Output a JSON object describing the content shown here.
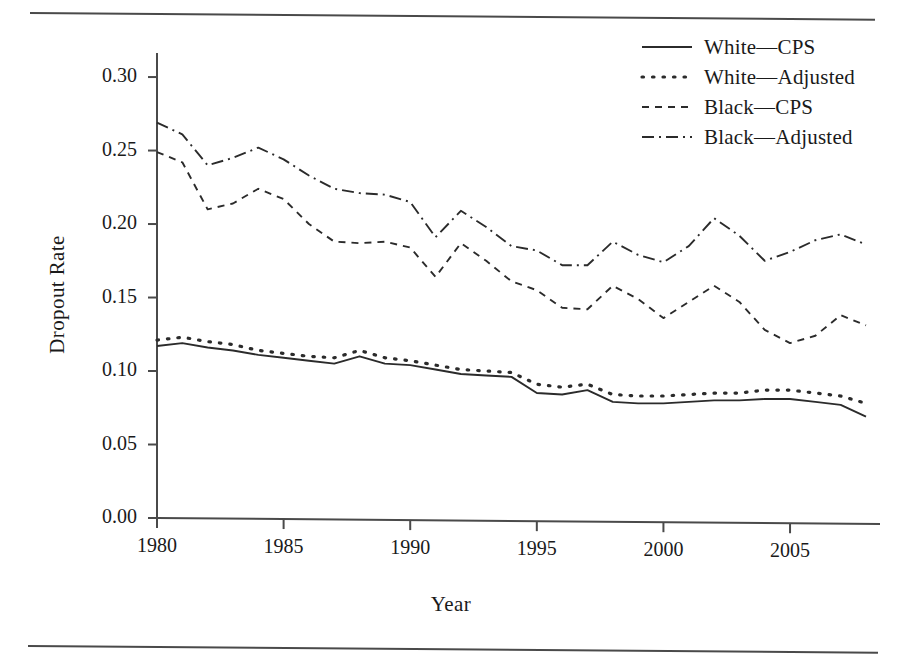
{
  "figure": {
    "has_top_rule": true,
    "has_bottom_rule": true,
    "ink_color": "#2b2b2b",
    "axis_color": "#4a4a4a",
    "background": "#ffffff"
  },
  "chart_data": {
    "type": "line",
    "title": "",
    "xlabel": "Year",
    "ylabel": "Dropout Rate",
    "xlim": [
      1980,
      2008
    ],
    "ylim": [
      0.0,
      0.315
    ],
    "grid": false,
    "legend_position": "top-right",
    "xticks": [
      1980,
      1985,
      1990,
      1995,
      2000,
      2005
    ],
    "xtick_labels": [
      "1980",
      "1985",
      "1990",
      "1995",
      "2000",
      "2005"
    ],
    "yticks": [
      0.0,
      0.05,
      0.1,
      0.15,
      0.2,
      0.25,
      0.3
    ],
    "ytick_labels": [
      "0.00",
      "0.05",
      "0.10",
      "0.15",
      "0.20",
      "0.25",
      "0.30"
    ],
    "x": [
      1980,
      1981,
      1982,
      1983,
      1984,
      1985,
      1986,
      1987,
      1988,
      1989,
      1990,
      1991,
      1992,
      1993,
      1994,
      1995,
      1996,
      1997,
      1998,
      1999,
      2000,
      2001,
      2002,
      2003,
      2004,
      2005,
      2006,
      2007,
      2008
    ],
    "series": [
      {
        "name": "White—CPS",
        "style": "solid",
        "values": [
          0.117,
          0.119,
          0.116,
          0.114,
          0.111,
          0.109,
          0.107,
          0.105,
          0.11,
          0.105,
          0.104,
          0.101,
          0.098,
          0.097,
          0.096,
          0.085,
          0.084,
          0.087,
          0.079,
          0.078,
          0.078,
          0.079,
          0.08,
          0.08,
          0.081,
          0.081,
          0.079,
          0.077,
          0.069
        ]
      },
      {
        "name": "White—Adjusted",
        "style": "dotted",
        "values": [
          0.121,
          0.123,
          0.12,
          0.118,
          0.114,
          0.112,
          0.11,
          0.109,
          0.114,
          0.109,
          0.107,
          0.104,
          0.101,
          0.1,
          0.099,
          0.091,
          0.089,
          0.091,
          0.084,
          0.083,
          0.083,
          0.084,
          0.085,
          0.085,
          0.087,
          0.087,
          0.085,
          0.083,
          0.078
        ]
      },
      {
        "name": "Black—CPS",
        "style": "dashed",
        "values": [
          0.249,
          0.242,
          0.21,
          0.214,
          0.224,
          0.217,
          0.2,
          0.188,
          0.187,
          0.188,
          0.184,
          0.164,
          0.187,
          0.175,
          0.161,
          0.155,
          0.143,
          0.142,
          0.158,
          0.149,
          0.136,
          0.147,
          0.158,
          0.147,
          0.128,
          0.119,
          0.124,
          0.138,
          0.131
        ]
      },
      {
        "name": "Black—Adjusted",
        "style": "dashdot",
        "values": [
          0.269,
          0.261,
          0.24,
          0.245,
          0.252,
          0.244,
          0.233,
          0.224,
          0.221,
          0.22,
          0.215,
          0.191,
          0.209,
          0.198,
          0.185,
          0.182,
          0.172,
          0.172,
          0.188,
          0.179,
          0.174,
          0.185,
          0.204,
          0.192,
          0.175,
          0.181,
          0.189,
          0.193,
          0.186
        ]
      }
    ]
  },
  "legend": {
    "entries": [
      {
        "label": "White—CPS",
        "style": "solid"
      },
      {
        "label": "White—Adjusted",
        "style": "dotted"
      },
      {
        "label": "Black—CPS",
        "style": "dashed"
      },
      {
        "label": "Black—Adjusted",
        "style": "dashdot"
      }
    ]
  }
}
